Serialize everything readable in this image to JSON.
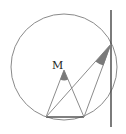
{
  "diagram": {
    "labels": {
      "M": "M"
    },
    "colors": {
      "circle": "#8a8a8a",
      "line": "#8c8c8c",
      "tangent": "#444444",
      "chord": "#555555",
      "shade": "#7a7a7a"
    },
    "circle": {
      "cx": 64,
      "cy": 67,
      "r": 53
    },
    "points": {
      "M": [
        64,
        70
      ],
      "A": [
        46,
        117
      ],
      "B": [
        84,
        117
      ],
      "P": [
        111,
        44
      ]
    },
    "tangent_line": {
      "x": 111,
      "y1": 10,
      "y2": 127
    }
  }
}
